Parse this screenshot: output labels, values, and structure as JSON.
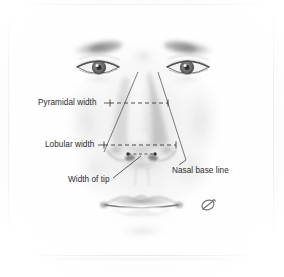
{
  "figure": {
    "domain": "anatomical-illustration",
    "medium": "grayscale pencil / airbrush medical illustration",
    "background_color": "#ffffff",
    "plate_border_color": "#f0f0f0",
    "ink_color": "#2b2b2b",
    "line_color": "#555555",
    "skin_shadow_color": "#9a9a9a"
  },
  "annotations": {
    "labels": [
      {
        "id": "pyramidal-width",
        "text": "Pyramidal width"
      },
      {
        "id": "lobular-width",
        "text": "Lobular width"
      },
      {
        "id": "width-of-tip",
        "text": "Width of tip"
      },
      {
        "id": "nasal-base-line",
        "text": "Nasal base line"
      }
    ],
    "measurement_lines": [
      {
        "id": "pyramidal-width-line",
        "style": "dashed",
        "orientation": "horizontal",
        "x1": 110,
        "y1": 103,
        "x2": 168,
        "y2": 103,
        "end_caps": "tick"
      },
      {
        "id": "lobular-width-line",
        "style": "dashed",
        "orientation": "horizontal",
        "x1": 104,
        "y1": 145,
        "x2": 176,
        "y2": 145,
        "end_caps": "tick"
      },
      {
        "id": "width-of-tip-line",
        "style": "dashed",
        "orientation": "horizontal",
        "x1": 127,
        "y1": 155,
        "x2": 155,
        "y2": 155,
        "end_caps": "dot"
      }
    ],
    "nasal_base_lines": [
      {
        "id": "nasal-base-left",
        "x1": 138,
        "y1": 72,
        "x2": 104,
        "y2": 152
      },
      {
        "id": "nasal-base-right",
        "x1": 158,
        "y1": 72,
        "x2": 186,
        "y2": 160
      }
    ],
    "leaders": [
      {
        "id": "leader-width-of-tip",
        "x1": 112,
        "y1": 180,
        "x2": 140,
        "y2": 158
      },
      {
        "id": "leader-nasal-base",
        "x1": 186,
        "y1": 160,
        "x2": 178,
        "y2": 166
      }
    ]
  },
  "signature": {
    "id": "artist-monogram",
    "text": "Ø",
    "description": "small stylized artist monogram, lower right of the plate"
  }
}
